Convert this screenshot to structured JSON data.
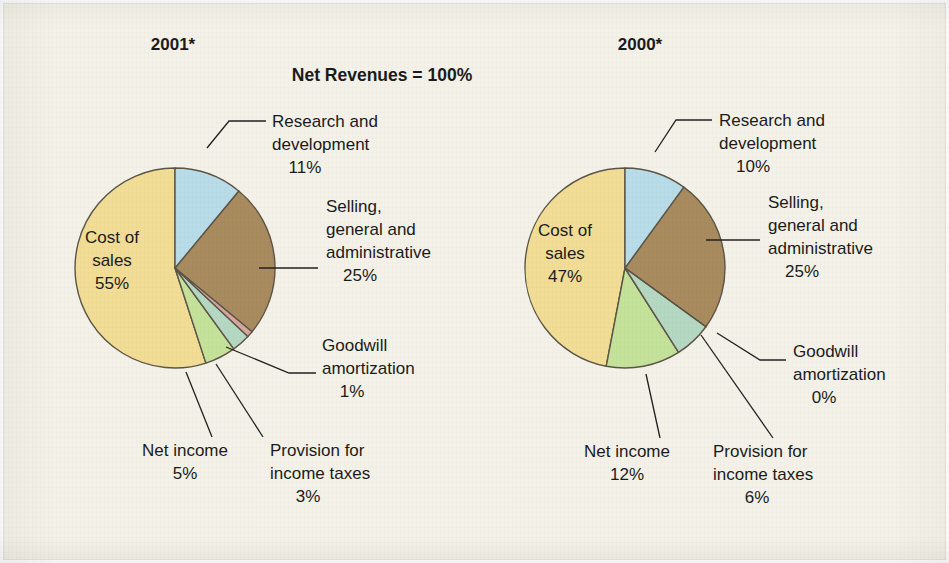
{
  "figure": {
    "title": "Net Revenues = 100%",
    "background_color": "#f4f2e8",
    "panels": [
      {
        "id": "panel-2001",
        "label": "2001*"
      },
      {
        "id": "panel-2000",
        "label": "2000*"
      }
    ]
  },
  "palette": {
    "research_and_development": "#b8dce8",
    "selling_general_administrative": "#a88b5e",
    "goodwill_amortization": "#d7a79f",
    "provision_for_income_taxes": "#b5d8c2",
    "net_income": "#c4e29a",
    "cost_of_sales": "#f2dd96",
    "outline": "#5c5547",
    "text": "#1b1b1b"
  },
  "chart_data": [
    {
      "type": "pie",
      "title": "2001*",
      "subtitle": "Net Revenues = 100%",
      "categories": [
        "Research and development",
        "Selling, general and administrative",
        "Goodwill amortization",
        "Provision for income taxes",
        "Net income",
        "Cost of sales"
      ],
      "values": [
        11,
        25,
        1,
        3,
        5,
        55
      ],
      "value_labels": [
        "11%",
        "25%",
        "1%",
        "3%",
        "5%",
        "55%"
      ],
      "unit": "%",
      "start_angle_deg": 0,
      "direction": "clockwise",
      "legend": "callout-labels"
    },
    {
      "type": "pie",
      "title": "2000*",
      "subtitle": "Net Revenues = 100%",
      "categories": [
        "Research and development",
        "Selling, general and administrative",
        "Goodwill amortization",
        "Provision for income taxes",
        "Net income",
        "Cost of sales"
      ],
      "values": [
        10,
        25,
        0,
        6,
        12,
        47
      ],
      "value_labels": [
        "10%",
        "25%",
        "0%",
        "6%",
        "12%",
        "47%"
      ],
      "unit": "%",
      "start_angle_deg": 0,
      "direction": "clockwise",
      "legend": "callout-labels"
    }
  ],
  "panel_2001": {
    "title": "2001*",
    "inside": {
      "cost_of_sales_line1": "Cost of",
      "cost_of_sales_line2": "sales",
      "cost_of_sales_value": "55%"
    },
    "callouts": {
      "rd_line1": "Research and",
      "rd_line2": "development",
      "rd_value": "11%",
      "sga_line1": "Selling,",
      "sga_line2": "general and",
      "sga_line3": "administrative",
      "sga_value": "25%",
      "goodwill_line1": "Goodwill",
      "goodwill_line2": "amortization",
      "goodwill_value": "1%",
      "netincome_line1": "Net income",
      "netincome_value": "5%",
      "provision_line1": "Provision for",
      "provision_line2": "income taxes",
      "provision_value": "3%"
    }
  },
  "panel_2000": {
    "title": "2000*",
    "inside": {
      "cost_of_sales_line1": "Cost of",
      "cost_of_sales_line2": "sales",
      "cost_of_sales_value": "47%"
    },
    "callouts": {
      "rd_line1": "Research and",
      "rd_line2": "development",
      "rd_value": "10%",
      "sga_line1": "Selling,",
      "sga_line2": "general and",
      "sga_line3": "administrative",
      "sga_value": "25%",
      "goodwill_line1": "Goodwill",
      "goodwill_line2": "amortization",
      "goodwill_value": "0%",
      "netincome_line1": "Net income",
      "netincome_value": "12%",
      "provision_line1": "Provision for",
      "provision_line2": "income taxes",
      "provision_value": "6%"
    }
  }
}
